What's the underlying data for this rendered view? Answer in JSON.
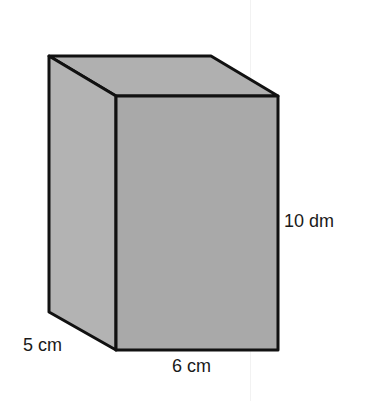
{
  "figure": {
    "type": "rectangular-prism",
    "dimensions": {
      "height": "10 dm",
      "depth": "5 cm",
      "width": "6 cm"
    },
    "colors": {
      "front_face": "#a9a9a9",
      "side_face": "#b3b3b3",
      "top_face": "#b0b0b0",
      "edge": "#111111"
    }
  }
}
